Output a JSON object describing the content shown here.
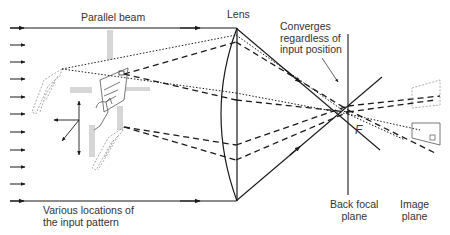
{
  "diagram": {
    "type": "optics-ray-diagram",
    "labels": {
      "parallel_beam": "Parallel beam",
      "lens": "Lens",
      "converges": "Converges\nregardless of\ninput position",
      "various_locations": "Various locations of\nthe input pattern",
      "back_focal_plane": "Back focal\nplane",
      "image_plane": "Image\nplane",
      "focal_point": "F"
    },
    "components": [
      {
        "id": "input-arrows",
        "description": "incoming parallel rays on the left",
        "count": 11
      },
      {
        "id": "input-pattern",
        "description": "hand-holding-slide pattern shown at several locations with motion arrows"
      },
      {
        "id": "lens",
        "description": "plano-convex lens"
      },
      {
        "id": "back-focal-plane",
        "description": "vertical line through focal point F"
      },
      {
        "id": "image-plane",
        "description": "inclined output plane with projected images"
      }
    ],
    "ray_styles": [
      "solid",
      "dotted",
      "dashed"
    ],
    "colors": {
      "line": "#1a1a1a",
      "ghost": "#8a8a8a",
      "text": "#333333"
    }
  }
}
